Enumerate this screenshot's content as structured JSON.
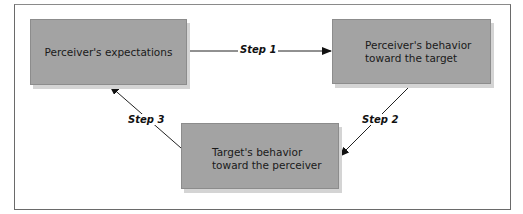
{
  "diagram": {
    "type": "cycle",
    "nodes": [
      {
        "id": "box1",
        "label": "Perceiver's expectations"
      },
      {
        "id": "box2",
        "label": "Perceiver's behavior toward the target"
      },
      {
        "id": "box3",
        "label": "Target's behavior toward the perceiver"
      }
    ],
    "edges": [
      {
        "from": "box1",
        "to": "box2",
        "label": "Step 1"
      },
      {
        "from": "box2",
        "to": "box3",
        "label": "Step 2"
      },
      {
        "from": "box3",
        "to": "box1",
        "label": "Step 3"
      }
    ],
    "colors": {
      "box_fill": "#a3a3a3",
      "box_shadow": "#d4d4d4",
      "frame": "#6a6a6a",
      "arrow": "#111111"
    }
  }
}
